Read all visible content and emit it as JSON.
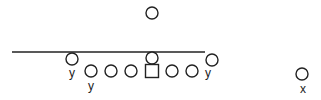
{
  "diagram": {
    "title": "",
    "colors": {
      "stroke": "#222222",
      "background": "#ffffff"
    },
    "line_of_scrimmage": {
      "x1": 12,
      "x2": 205,
      "y": 52
    },
    "players": [
      {
        "id": "deep-back",
        "shape": "circle",
        "cx": 152,
        "cy": 13,
        "r": 6,
        "label": ""
      },
      {
        "id": "left-end",
        "shape": "circle",
        "cx": 72,
        "cy": 59,
        "r": 6,
        "label": "y"
      },
      {
        "id": "center-back",
        "shape": "circle",
        "cx": 152,
        "cy": 58,
        "r": 6,
        "label": ""
      },
      {
        "id": "right-end",
        "shape": "circle",
        "cx": 212,
        "cy": 60,
        "r": 6,
        "label": "y"
      },
      {
        "id": "lineman-1",
        "shape": "circle",
        "cx": 91,
        "cy": 71,
        "r": 6,
        "label": "y"
      },
      {
        "id": "lineman-2",
        "shape": "circle",
        "cx": 111,
        "cy": 71,
        "r": 6,
        "label": ""
      },
      {
        "id": "lineman-3",
        "shape": "circle",
        "cx": 131,
        "cy": 71,
        "r": 6,
        "label": ""
      },
      {
        "id": "center",
        "shape": "square",
        "cx": 152,
        "cy": 71,
        "size": 13,
        "label": ""
      },
      {
        "id": "lineman-5",
        "shape": "circle",
        "cx": 172,
        "cy": 71,
        "r": 6,
        "label": ""
      },
      {
        "id": "lineman-6",
        "shape": "circle",
        "cx": 192,
        "cy": 71,
        "r": 6,
        "label": ""
      },
      {
        "id": "flanker",
        "shape": "circle",
        "cx": 302,
        "cy": 74,
        "r": 6,
        "label": "x"
      }
    ],
    "labels": [
      {
        "text": "y",
        "x": 72,
        "y": 67
      },
      {
        "text": "y",
        "x": 91,
        "y": 80
      },
      {
        "text": "y",
        "x": 208,
        "y": 67
      },
      {
        "text": "x",
        "x": 303,
        "y": 83
      }
    ]
  }
}
